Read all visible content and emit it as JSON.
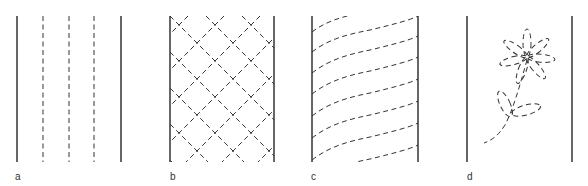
{
  "figure": {
    "stroke_color": "#333333",
    "background": "#ffffff",
    "panels": [
      {
        "id": "a",
        "label": "a",
        "pattern": "parallel vertical dashed lines"
      },
      {
        "id": "b",
        "label": "b",
        "pattern": "diagonal dashed crosshatch (diamond lattice)"
      },
      {
        "id": "c",
        "label": "c",
        "pattern": "wavy diagonal dashed lines"
      },
      {
        "id": "d",
        "label": "d",
        "pattern": "dashed flower outline with stem and leaves"
      }
    ]
  }
}
